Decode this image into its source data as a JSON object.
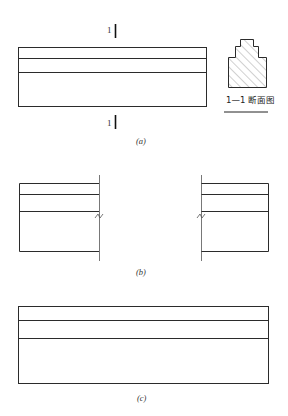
{
  "figure_a": {
    "caption": "(a)",
    "section_mark_top": "1",
    "section_mark_bottom": "1",
    "section_title": "1—1 断面图",
    "layers": 3
  },
  "figure_b": {
    "caption": "(b)",
    "layers": 3
  },
  "figure_c": {
    "caption": "(c)",
    "layers": 3
  }
}
